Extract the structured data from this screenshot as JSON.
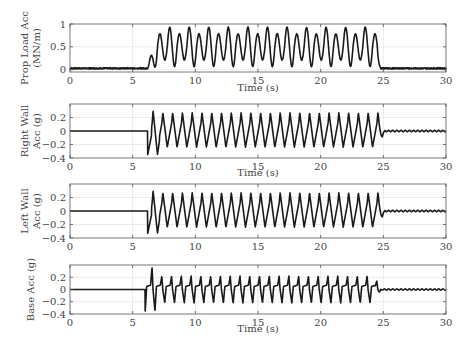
{
  "chart_data": [
    {
      "type": "line",
      "title": "",
      "ylabel": "Prop Load Acc (MN/m)",
      "ylabel_lines": [
        "Prop Load Acc",
        "(MN/m)"
      ],
      "xlabel": "Time (s)",
      "xlim": [
        0,
        30
      ],
      "ylim": [
        -0.05,
        1
      ],
      "xticks": [
        0,
        5,
        10,
        15,
        20,
        25,
        30
      ],
      "yticks": [
        0,
        0.5,
        1
      ],
      "ytick_labels": [
        "0",
        "0.5",
        "1"
      ],
      "grid": true,
      "series": [
        {
          "name": "Prop Load",
          "signal": {
            "quiet_level": 0.03,
            "noise": 0.015,
            "onset": 6.2,
            "ramp_end": 7.0,
            "end": 24.5,
            "mean": 0.5,
            "amplitude_a": 0.45,
            "amplitude_b": 0.3,
            "period": 0.78
          }
        }
      ]
    },
    {
      "type": "line",
      "title": "",
      "ylabel": "Right Wall Acc (g)",
      "ylabel_lines": [
        "Right Wall",
        "Acc (g)"
      ],
      "xlabel": "Time (s)",
      "xlim": [
        0,
        30
      ],
      "ylim": [
        -0.4,
        0.4
      ],
      "xticks": [
        0,
        5,
        10,
        15,
        20,
        25,
        30
      ],
      "yticks": [
        0.2,
        0,
        -0.2,
        -0.4
      ],
      "ytick_labels": [
        "0.2",
        "0",
        "-0.2",
        "-0.4"
      ],
      "grid": true,
      "series": [
        {
          "name": "Right Wall",
          "signal": {
            "onset": 6.2,
            "end": 24.6,
            "peak": 0.27,
            "trough": -0.24,
            "first_trough": -0.35,
            "first_peak": 0.3,
            "period": 0.78,
            "tail_ripple": 0.01
          }
        }
      ]
    },
    {
      "type": "line",
      "title": "",
      "ylabel": "Left Wall Acc (g)",
      "ylabel_lines": [
        "Left Wall",
        "Acc (g)"
      ],
      "xlabel": "",
      "xlim": [
        0,
        30
      ],
      "ylim": [
        -0.4,
        0.4
      ],
      "xticks": [
        0,
        5,
        10,
        15,
        20,
        25,
        30
      ],
      "yticks": [
        0.2,
        0,
        -0.2,
        -0.4
      ],
      "ytick_labels": [
        "0.2",
        "0",
        "-0.2",
        "-0.4"
      ],
      "grid": true,
      "series": [
        {
          "name": "Left Wall",
          "signal": {
            "onset": 6.2,
            "end": 24.6,
            "peak": 0.27,
            "trough": -0.24,
            "first_trough": -0.33,
            "first_peak": 0.3,
            "period": 0.78,
            "tail_ripple": 0.01
          }
        }
      ]
    },
    {
      "type": "line",
      "title": "",
      "ylabel": "Base Acc (g)",
      "ylabel_lines": [
        "Base Acc (g)"
      ],
      "xlabel": "Time (s)",
      "xlim": [
        0,
        30
      ],
      "ylim": [
        -0.4,
        0.4
      ],
      "xticks": [
        0,
        5,
        10,
        15,
        20,
        25,
        30
      ],
      "yticks": [
        0.2,
        0,
        -0.2,
        -0.4
      ],
      "ytick_labels": [
        "0.2",
        "0",
        "-0.2",
        "-0.4"
      ],
      "grid": true,
      "series": [
        {
          "name": "Base",
          "signal": {
            "onset": 6.0,
            "end": 24.3,
            "peak": 0.22,
            "trough": -0.22,
            "first_peak": 0.37,
            "first_trough": -0.35,
            "period": 0.78,
            "tail_ripple": 0.01
          }
        }
      ]
    }
  ],
  "panels": [
    {
      "x0": 70,
      "x1": 446,
      "y0": 24,
      "y1": 72,
      "xlabel_y": 91
    },
    {
      "x0": 70,
      "x1": 446,
      "y0": 104,
      "y1": 158,
      "xlabel_y": 176
    },
    {
      "x0": 70,
      "x1": 446,
      "y0": 184,
      "y1": 238,
      "xlabel_y": null
    },
    {
      "x0": 70,
      "x1": 446,
      "y0": 265,
      "y1": 314,
      "xlabel_y": 332
    }
  ]
}
